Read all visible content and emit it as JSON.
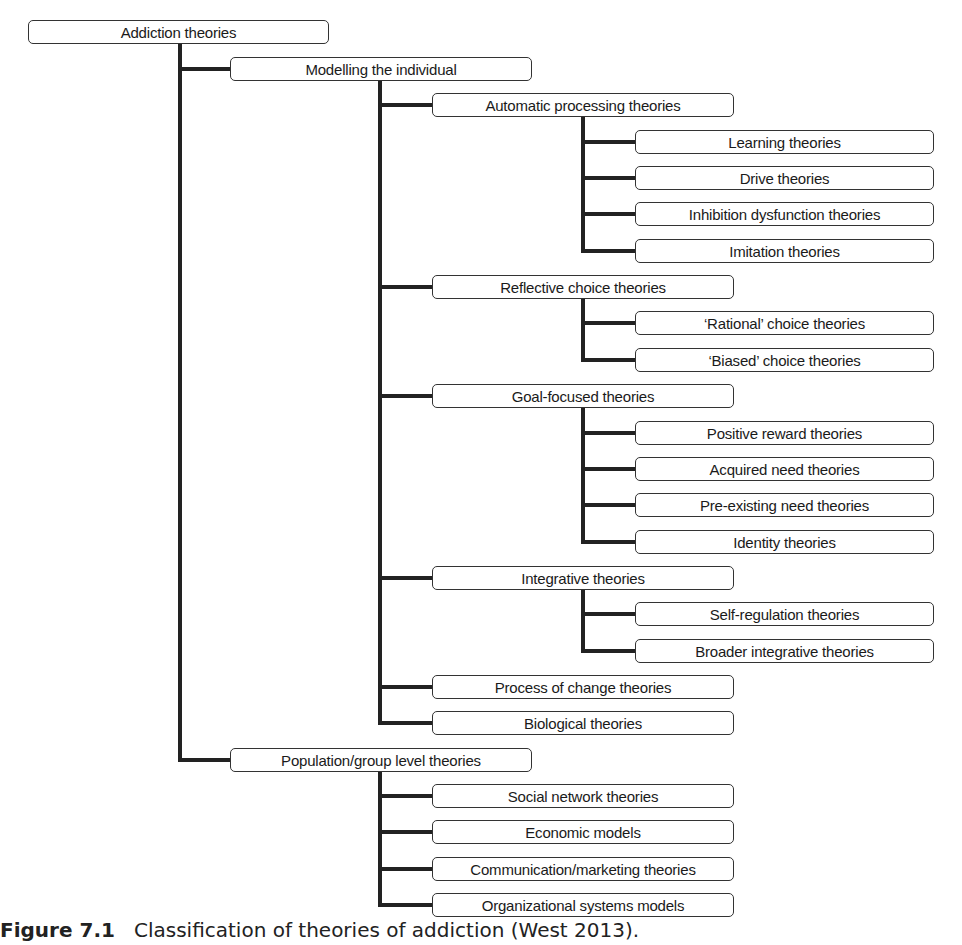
{
  "diagram": {
    "root": "Addiction theories",
    "nodes": [
      {
        "id": "modelling",
        "label": "Modelling the individual",
        "level": 1
      },
      {
        "id": "automatic",
        "label": "Automatic processing theories",
        "level": 2
      },
      {
        "id": "learning",
        "label": "Learning theories",
        "level": 3
      },
      {
        "id": "drive",
        "label": "Drive theories",
        "level": 3
      },
      {
        "id": "inhibition",
        "label": "Inhibition dysfunction theories",
        "level": 3
      },
      {
        "id": "imitation",
        "label": "Imitation theories",
        "level": 3
      },
      {
        "id": "reflective",
        "label": "Reflective choice theories",
        "level": 2
      },
      {
        "id": "rational",
        "label": "‘Rational’ choice theories",
        "level": 3
      },
      {
        "id": "biased",
        "label": "‘Biased’ choice theories",
        "level": 3
      },
      {
        "id": "goal",
        "label": "Goal-focused theories",
        "level": 2
      },
      {
        "id": "positive",
        "label": "Positive reward theories",
        "level": 3
      },
      {
        "id": "acquired",
        "label": "Acquired need theories",
        "level": 3
      },
      {
        "id": "preexisting",
        "label": "Pre-existing need theories",
        "level": 3
      },
      {
        "id": "identity",
        "label": "Identity theories",
        "level": 3
      },
      {
        "id": "integrative",
        "label": "Integrative theories",
        "level": 2
      },
      {
        "id": "selfreg",
        "label": "Self-regulation theories",
        "level": 3
      },
      {
        "id": "broader",
        "label": "Broader integrative theories",
        "level": 3
      },
      {
        "id": "process",
        "label": "Process of change theories",
        "level": 2
      },
      {
        "id": "biological",
        "label": "Biological theories",
        "level": 2
      },
      {
        "id": "population",
        "label": "Population/group level theories",
        "level": 1
      },
      {
        "id": "social",
        "label": "Social network theories",
        "level": 2
      },
      {
        "id": "economic",
        "label": "Economic models",
        "level": 2
      },
      {
        "id": "communication",
        "label": "Communication/marketing theories",
        "level": 2
      },
      {
        "id": "organizational",
        "label": "Organizational systems models",
        "level": 2
      }
    ]
  },
  "caption": {
    "figure_label": "Figure 7.1",
    "text": "Classification of theories of addiction (West 2013)."
  }
}
